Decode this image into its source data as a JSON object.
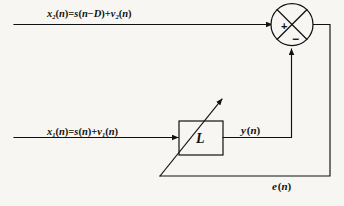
{
  "figure": {
    "kind": "block-diagram",
    "background_color": "#f7f6f2",
    "ink_color": "#111111"
  },
  "signals": {
    "reference_input": {
      "name": "x2",
      "base": "x",
      "subscript": "2",
      "equation_rhs_first": "s(n−D)",
      "equation_rhs_second": "v2(n)",
      "full_text": "x₂(n)=s(n−D)+v₂(n)"
    },
    "primary_input": {
      "name": "x1",
      "base": "x",
      "subscript": "1",
      "equation_rhs_first": "s(n)",
      "equation_rhs_second": "v1(n)",
      "full_text": "x₁(n)=s(n)+v₁(n)"
    },
    "filter_output": {
      "name": "y",
      "full_text": "y(n)"
    },
    "error_output": {
      "name": "e",
      "full_text": "e(n)"
    }
  },
  "blocks": {
    "adaptive_filter": {
      "label": "L",
      "shape": "rectangle"
    },
    "summing_junction": {
      "shape": "circle-with-x",
      "plus_sign": "+",
      "minus_sign": "−",
      "plus_input_side": "left",
      "minus_input_side": "bottom"
    }
  },
  "annotations": {
    "adaptation_arrow": "diagonal-arrow-through-filter",
    "feedback_path": "e(n)"
  }
}
